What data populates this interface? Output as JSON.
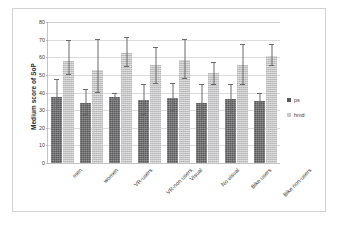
{
  "chart_data": {
    "type": "bar",
    "title": "",
    "subtitle": "",
    "xlabel": "",
    "ylabel": "Medium score of SoP",
    "ylim": [
      0,
      80
    ],
    "ytick_step": 10,
    "yticks": [
      0,
      10,
      20,
      30,
      40,
      50,
      60,
      70,
      80
    ],
    "grid": true,
    "legend_position": "right",
    "categories": [
      "men",
      "women",
      "VR-users",
      "VR-non users",
      "Visual",
      "No visual",
      "Bike users",
      "Bike non-users"
    ],
    "series": [
      {
        "name": "ps",
        "color": "#59595b",
        "values": [
          37.5,
          34.0,
          37.5,
          36.0,
          37.0,
          34.0,
          36.5,
          35.0
        ],
        "err_low": [
          7.5,
          7.0,
          1.5,
          9.0,
          7.5,
          9.5,
          8.5,
          4.0
        ],
        "err_high": [
          9.5,
          7.5,
          1.5,
          8.0,
          8.0,
          10.0,
          8.0,
          4.0
        ]
      },
      {
        "name": "hmd",
        "color": "#c3c3c5",
        "values": [
          58.0,
          52.5,
          62.5,
          55.5,
          58.5,
          51.0,
          55.5,
          61.0
        ],
        "err_low": [
          8.0,
          13.0,
          8.0,
          10.5,
          11.0,
          7.0,
          11.5,
          6.0
        ],
        "err_high": [
          11.5,
          17.5,
          8.5,
          10.0,
          11.5,
          6.0,
          11.5,
          6.0
        ]
      }
    ]
  },
  "legend": {
    "items": [
      {
        "label": "ps"
      },
      {
        "label": "hmd"
      }
    ]
  },
  "axis": {
    "y_title": "Medium score of SoP"
  }
}
